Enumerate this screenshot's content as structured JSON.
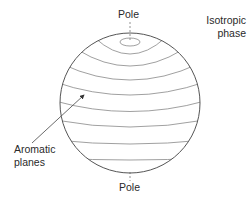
{
  "diagram": {
    "labels": {
      "pole_top": "Pole",
      "pole_bottom": "Pole",
      "isotropic_line1": "Isotropic",
      "isotropic_line2": "phase",
      "aromatic_line1": "Aromatic",
      "aromatic_line2": "planes"
    },
    "sphere": {
      "cx": 130,
      "cy": 103,
      "r": 70,
      "stroke": "#555555"
    },
    "layer_count": 8,
    "arrow": {
      "from": [
        30,
        145
      ],
      "to": [
        85,
        94
      ]
    }
  }
}
